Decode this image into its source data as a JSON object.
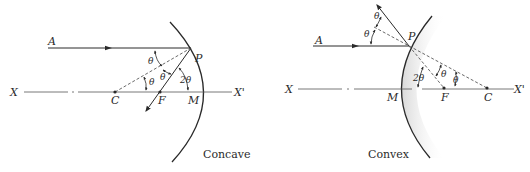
{
  "figure": {
    "panels": [
      {
        "id": "concave",
        "caption": "Concave",
        "labels": {
          "A": "A",
          "P": "P",
          "X": "X",
          "X_prime": "X'",
          "C": "C",
          "F": "F",
          "M": "M"
        },
        "angles": {
          "theta1": "θ",
          "theta2": "θ",
          "theta3": "θ",
          "two_theta": "2θ"
        }
      },
      {
        "id": "convex",
        "caption": "Convex",
        "labels": {
          "A": "A",
          "P": "P",
          "X": "X",
          "X_prime": "X'",
          "C": "C",
          "F": "F",
          "M": "M"
        },
        "angles": {
          "theta1": "θ",
          "theta2": "θ",
          "theta3": "θ",
          "theta4": "θ",
          "two_theta": "2θ"
        }
      }
    ],
    "colors": {
      "line": "#2a2a2a",
      "mirror_shade": "#d8d8d8",
      "background": "#ffffff"
    }
  }
}
